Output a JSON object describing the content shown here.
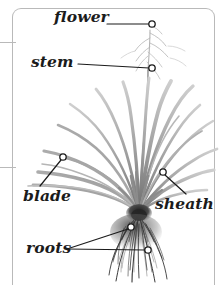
{
  "figure": {
    "title_visible": false,
    "background_color": "#ffffff",
    "frame_color": "#b9b9b9",
    "label_color": "#1b1b1b",
    "leader_color": "#1b1b1b",
    "marker_fill": "#ffffff",
    "plant_color": "#8a8a8a"
  },
  "callouts": [
    {
      "id": "flower",
      "label": "flower",
      "marker": {
        "x": 152,
        "y": 24
      },
      "leader_start": {
        "x": 107,
        "y": 24
      }
    },
    {
      "id": "stem",
      "label": "stem",
      "marker": {
        "x": 152,
        "y": 68
      },
      "leader_start": {
        "x": 78,
        "y": 64
      }
    },
    {
      "id": "blade",
      "label": "blade",
      "marker": {
        "x": 63,
        "y": 157
      },
      "leader_start": {
        "x": 40,
        "y": 186
      }
    },
    {
      "id": "sheath",
      "label": "sheath",
      "marker": {
        "x": 163,
        "y": 172
      },
      "leader_start": {
        "x": 186,
        "y": 194
      }
    },
    {
      "id": "roots",
      "label": "roots",
      "marker": {
        "x": 131,
        "y": 227
      },
      "marker2": {
        "x": 148,
        "y": 250
      },
      "leader_start": {
        "x": 67,
        "y": 249
      }
    }
  ],
  "frame": {
    "rules": [
      {
        "id": "rule-top",
        "y": 42
      },
      {
        "id": "rule-mid",
        "y": 167
      }
    ]
  }
}
